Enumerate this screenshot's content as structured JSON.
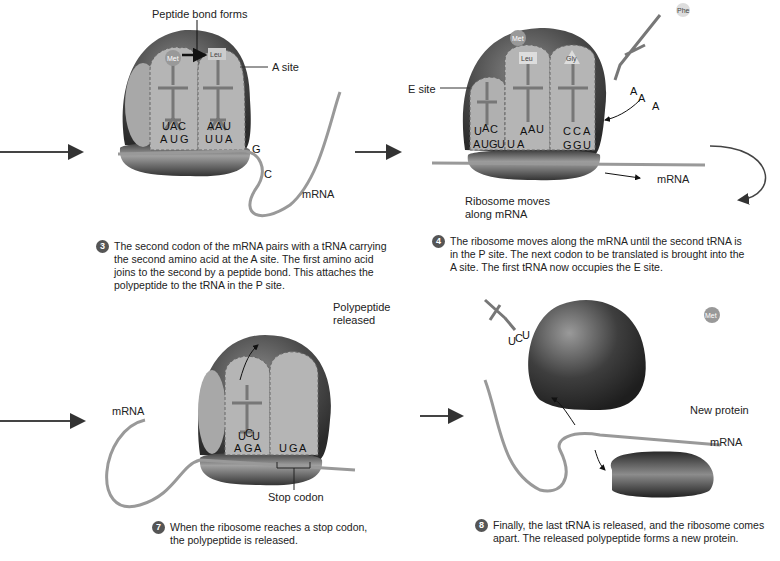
{
  "panels": [
    {
      "id": "step3",
      "step": "3",
      "labels": {
        "top": "Peptide bond forms",
        "site": "A site",
        "mrna": "mRNA"
      },
      "amino_acids": [
        "Met",
        "Leu"
      ],
      "anticodons": [
        [
          "U",
          "A",
          "C"
        ],
        [
          "A",
          "A",
          "U"
        ]
      ],
      "codons": [
        "A",
        "U",
        "G",
        "U",
        "U",
        "A"
      ],
      "extra_bases": [
        "G",
        "C"
      ],
      "caption": [
        "The second codon of the mRNA pairs with a tRNA carrying",
        "the second amino acid at the A site. The first amino acid",
        "joins to the second by a peptide bond. This attaches the",
        "polypeptide to the tRNA in the P site."
      ]
    },
    {
      "id": "step4",
      "step": "4",
      "labels": {
        "site": "E site",
        "moves": "Ribosome moves along mRNA",
        "moves_line1": "Ribosome moves",
        "moves_line2": "along mRNA",
        "mrna": "mRNA"
      },
      "amino_acids": [
        "Met",
        "Leu",
        "Gly",
        "Phe"
      ],
      "anticodons": [
        [
          "U",
          "A",
          "C"
        ],
        [
          "A",
          "A",
          "U"
        ],
        [
          "C",
          "C",
          "A"
        ]
      ],
      "incoming_anticodon": [
        "A",
        "A",
        "A"
      ],
      "codons": [
        "A",
        "U",
        "G",
        "U",
        "U",
        "A",
        "G",
        "G",
        "U"
      ],
      "caption": [
        "The ribosome moves along the mRNA until the second tRNA is",
        "in the P site. The next codon to be translated is brought into the",
        "A site. The first tRNA now occupies the E site."
      ]
    },
    {
      "id": "step7",
      "step": "7",
      "labels": {
        "released1": "Polypeptide",
        "released2": "released",
        "mrna": "mRNA",
        "stop": "Stop codon"
      },
      "chain": [
        "Arg",
        "Met",
        "Leu",
        "Gly",
        "Phe",
        "Leu",
        "Gly",
        "Met",
        "Phe",
        "Gly",
        "Leu",
        "Met"
      ],
      "anticodon": [
        "U",
        "C",
        "U"
      ],
      "codons": [
        "A",
        "G",
        "A",
        "U",
        "G",
        "A"
      ],
      "caption": [
        "When the ribosome reaches a stop codon,",
        "the polypeptide is released."
      ]
    },
    {
      "id": "step8",
      "step": "8",
      "labels": {
        "protein": "New protein",
        "mrna": "mRNA"
      },
      "anticodon": [
        "U",
        "C",
        "U"
      ],
      "protein": [
        "Phe",
        "Gly",
        "Met",
        "Met",
        "Leu",
        "Gly",
        "Gly",
        "Leu",
        "Leu",
        "Phe",
        "Met",
        "Arg"
      ],
      "caption": [
        "Finally, the last tRNA is released, and the ribosome comes",
        "apart. The released polypeptide forms a new protein."
      ]
    }
  ]
}
